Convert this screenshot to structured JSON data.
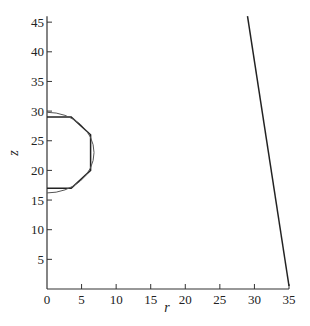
{
  "chart_data": {
    "type": "line",
    "title": "",
    "xlabel": "r",
    "ylabel": "z",
    "xlim": [
      0,
      35
    ],
    "ylim": [
      0,
      46
    ],
    "grid": false,
    "legend": null,
    "x_ticks": [
      0,
      5,
      10,
      15,
      20,
      25,
      30,
      35
    ],
    "y_ticks": [
      5,
      10,
      15,
      20,
      25,
      30,
      35,
      40,
      45
    ],
    "series": [
      {
        "name": "polygonal boundary",
        "points": [
          [
            0,
            29
          ],
          [
            3.5,
            29
          ],
          [
            6.3,
            26
          ],
          [
            6.3,
            20
          ],
          [
            3.5,
            17
          ],
          [
            0,
            17
          ]
        ]
      },
      {
        "name": "circular arc",
        "center": [
          0,
          23
        ],
        "radius": 6.8,
        "points": [
          [
            0,
            29.8
          ],
          [
            2.3,
            29.4
          ],
          [
            4.3,
            28.3
          ],
          [
            5.9,
            26.4
          ],
          [
            6.7,
            24.2
          ],
          [
            6.8,
            23
          ],
          [
            6.6,
            21.3
          ],
          [
            5.8,
            19.4
          ],
          [
            4.3,
            17.7
          ],
          [
            2.3,
            16.6
          ],
          [
            0,
            16.2
          ]
        ]
      },
      {
        "name": "outer boundary line",
        "points": [
          [
            29,
            46
          ],
          [
            35,
            0.5
          ]
        ]
      }
    ]
  }
}
